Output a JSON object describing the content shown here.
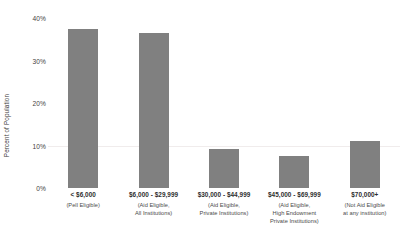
{
  "chart_data": {
    "type": "bar",
    "title": "",
    "xlabel": "",
    "ylabel": "Percent of Population",
    "ylim": [
      0,
      40
    ],
    "yticks": [
      "0%",
      "10%",
      "20%",
      "30%",
      "40%"
    ],
    "ytick_values": [
      0,
      10,
      20,
      30,
      40
    ],
    "grid": true,
    "legend": false,
    "bar_color": "#808080",
    "categories": [
      "< $6,000",
      "$6,000 - $29,999",
      "$30,000 - $44,999",
      "$45,000 - $69,999",
      "$70,000+"
    ],
    "category_sublabels": [
      [
        "(Pell Eligible)"
      ],
      [
        "(Aid Eligible,",
        "All Institutions)"
      ],
      [
        "(Aid Eligible,",
        "Private Institutions)"
      ],
      [
        "(Aid Eligible,",
        "High Endowment",
        "Private Institutions)"
      ],
      [
        "(Not Aid Eligible",
        "at any institution)"
      ]
    ],
    "values": [
      37.5,
      36.4,
      9.1,
      7.6,
      11.0
    ]
  },
  "axis": {
    "y_title": "Percent of Population"
  }
}
